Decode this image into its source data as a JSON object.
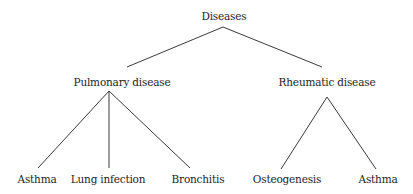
{
  "diagram": {
    "type": "tree",
    "colors": {
      "text": "#1e1e1e",
      "edge": "#3a3a3a",
      "background": "#ffffff"
    },
    "root": {
      "label": "Diseases",
      "children": [
        {
          "label": "Pulmonary disease",
          "children": [
            {
              "label": "Asthma"
            },
            {
              "label": "Lung infection"
            },
            {
              "label": "Bronchitis"
            }
          ]
        },
        {
          "label": "Rheumatic disease",
          "children": [
            {
              "label": "Osteogenesis"
            },
            {
              "label": "Asthma"
            }
          ]
        }
      ]
    }
  }
}
